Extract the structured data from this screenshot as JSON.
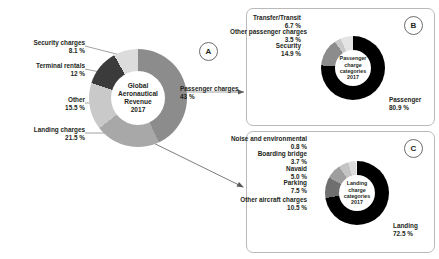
{
  "chart_data": [
    {
      "type": "pie",
      "id": "A",
      "title": "Global Aeronautical Revenue 2017",
      "center_lines": [
        "Global",
        "Aeronautical",
        "Revenue",
        "2017"
      ],
      "categories": [
        "Passenger charges",
        "Landing charges",
        "Other",
        "Terminal rentals",
        "Security charges"
      ],
      "values": [
        43,
        21.5,
        15.5,
        12,
        8.1
      ],
      "value_labels": [
        "43 %",
        "21.5 %",
        "15.5 %",
        "12 %",
        "8.1 %"
      ],
      "colors": [
        "#8c8c8c",
        "#a8a8a8",
        "#c9c9c9",
        "#3b3b3b",
        "#dcdcdc"
      ],
      "legend": "outside-labels",
      "grid": false
    },
    {
      "type": "pie",
      "id": "B",
      "title": "Passenger charge categories 2017",
      "center_lines": [
        "Passenger",
        "charge",
        "categories",
        "2017"
      ],
      "categories": [
        "Passenger",
        "Security",
        "Other passenger charges",
        "Transfer/Transit"
      ],
      "values": [
        80.9,
        14.9,
        3.5,
        6.7
      ],
      "value_labels": [
        "80.9 %",
        "14.9 %",
        "3.5 %",
        "6.7 %"
      ],
      "colors": [
        "#000000",
        "#8c8c8c",
        "#c9c9c9",
        "#e4e4e4"
      ],
      "legend": "outside-labels",
      "grid": false
    },
    {
      "type": "pie",
      "id": "C",
      "title": "Landing charge categories 2017",
      "center_lines": [
        "Landing",
        "charge",
        "categories",
        "2017"
      ],
      "categories": [
        "Landing",
        "Other aircraft charges",
        "Parking",
        "Navaid",
        "Boarding bridge",
        "Noise and environmental"
      ],
      "values": [
        72.5,
        10.5,
        7.5,
        5.0,
        3.7,
        0.8
      ],
      "value_labels": [
        "72.5 %",
        "10.5 %",
        "7.5 %",
        "5.0 %",
        "3.7 %",
        "0.8 %"
      ],
      "colors": [
        "#000000",
        "#6f6f6f",
        "#9e9e9e",
        "#c4c4c4",
        "#dcdcdc",
        "#efefef"
      ],
      "legend": "outside-labels",
      "grid": false
    }
  ],
  "main": {
    "center": {
      "l1": "Global",
      "l2": "Aeronautical",
      "l3": "Revenue",
      "l4": "2017"
    },
    "labels": {
      "security": {
        "name": "Security charges",
        "value": "8.1 %"
      },
      "terminal": {
        "name": "Terminal rentals",
        "value": "12 %"
      },
      "other": {
        "name": "Other",
        "value": "15.5 %"
      },
      "landing": {
        "name": "Landing charges",
        "value": "21.5 %"
      },
      "passenger": {
        "name": "Passenger charges",
        "value": "43 %"
      }
    }
  },
  "callouts": {
    "a": "A",
    "b": "B",
    "c": "C"
  },
  "panel_b": {
    "center": {
      "l1": "Passenger",
      "l2": "charge",
      "l3": "categories",
      "l4": "2017"
    },
    "labels": {
      "transfer": {
        "name": "Transfer/Transit",
        "value": "6.7 %"
      },
      "otherpax": {
        "name": "Other passenger charges",
        "value": "3.5 %"
      },
      "security": {
        "name": "Security",
        "value": "14.9 %"
      },
      "passenger": {
        "name": "Passenger",
        "value": "80.9 %"
      }
    }
  },
  "panel_c": {
    "center": {
      "l1": "Landing",
      "l2": "charge",
      "l3": "categories",
      "l4": "2017"
    },
    "labels": {
      "noise": {
        "name": "Noise and environmental",
        "value": "0.8 %"
      },
      "boarding": {
        "name": "Boarding bridge",
        "value": "3.7 %"
      },
      "navaid": {
        "name": "Navaid",
        "value": "5.0 %"
      },
      "parking": {
        "name": "Parking",
        "value": "7.5 %"
      },
      "otherac": {
        "name": "Other aircraft charges",
        "value": "10.5 %"
      },
      "landing": {
        "name": "Landing",
        "value": "72.5 %"
      }
    }
  }
}
